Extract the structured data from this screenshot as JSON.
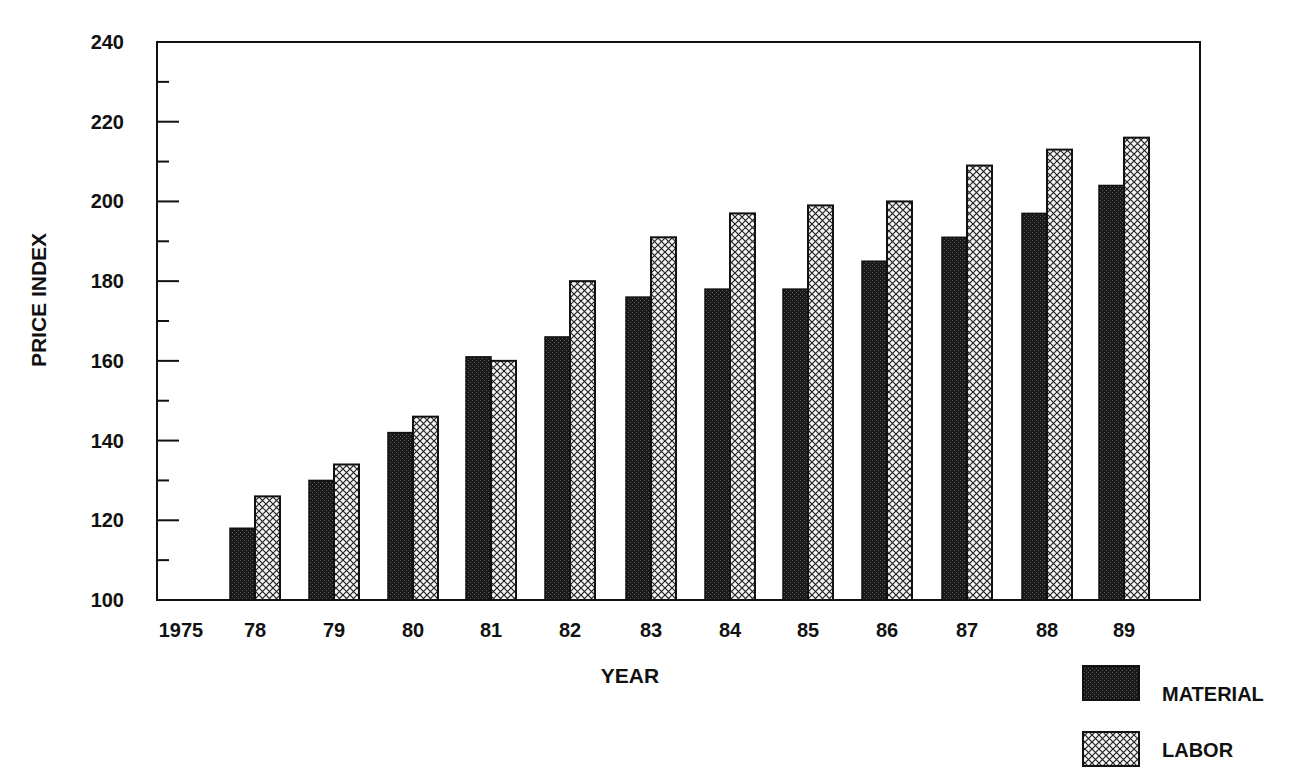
{
  "chart_data": {
    "type": "bar",
    "title": "",
    "xlabel": "YEAR",
    "ylabel": "PRICE INDEX",
    "ylim": [
      100,
      240
    ],
    "yticks": [
      100,
      120,
      140,
      160,
      180,
      200,
      220,
      240
    ],
    "grid": false,
    "legend_position": "bottom-right",
    "categories": [
      "1975",
      "78",
      "79",
      "80",
      "81",
      "82",
      "83",
      "84",
      "85",
      "86",
      "87",
      "88",
      "89"
    ],
    "series": [
      {
        "name": "MATERIAL",
        "pattern": "dark-stipple",
        "values": [
          null,
          118,
          130,
          142,
          161,
          166,
          176,
          178,
          178,
          185,
          191,
          197,
          204
        ]
      },
      {
        "name": "LABOR",
        "pattern": "crosshatch",
        "values": [
          null,
          126,
          134,
          146,
          160,
          180,
          191,
          197,
          199,
          200,
          209,
          213,
          216
        ]
      }
    ]
  },
  "legend": {
    "material_label": "MATERIAL",
    "labor_label": "LABOR"
  },
  "colors": {
    "material": "#1a1a1a",
    "labor_bg": "#f4f4f4",
    "line": "#111111"
  }
}
